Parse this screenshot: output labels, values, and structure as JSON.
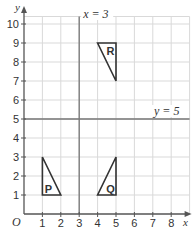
{
  "diagram": {
    "axes": {
      "x_label": "x",
      "y_label": "y",
      "origin_label": "O",
      "x_ticks": [
        "1",
        "2",
        "3",
        "4",
        "5",
        "6",
        "7",
        "8"
      ],
      "y_ticks": [
        "1",
        "2",
        "3",
        "4",
        "5",
        "6",
        "7",
        "8",
        "9",
        "10"
      ],
      "x_range": [
        0,
        9
      ],
      "y_range": [
        0,
        10.5
      ]
    },
    "lines": {
      "vertical": {
        "label": "x = 3",
        "x": 3
      },
      "horizontal": {
        "label": "y = 5",
        "y": 5
      }
    },
    "shapes": [
      {
        "label": "P",
        "vertices": [
          [
            1,
            1
          ],
          [
            1,
            3
          ],
          [
            2,
            1
          ]
        ]
      },
      {
        "label": "Q",
        "vertices": [
          [
            4,
            1
          ],
          [
            5,
            1
          ],
          [
            5,
            3
          ]
        ]
      },
      {
        "label": "R",
        "vertices": [
          [
            4,
            9
          ],
          [
            5,
            9
          ],
          [
            5,
            7
          ]
        ]
      }
    ],
    "colors": {
      "grid": "#d9d9d9",
      "axis": "#555555",
      "mirror_line": "#777777",
      "shape_stroke": "#333333",
      "text": "#333333"
    }
  }
}
